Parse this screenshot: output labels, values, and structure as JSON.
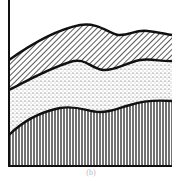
{
  "figure": {
    "caption": "(b)",
    "colors": {
      "ink": "#111111",
      "background": "#ffffff"
    },
    "layers": [
      {
        "name": "top-layer",
        "pattern": "diagonal-hatch"
      },
      {
        "name": "middle-layer",
        "pattern": "stipple-dots"
      },
      {
        "name": "bottom-layer",
        "pattern": "vertical-lines"
      }
    ]
  }
}
